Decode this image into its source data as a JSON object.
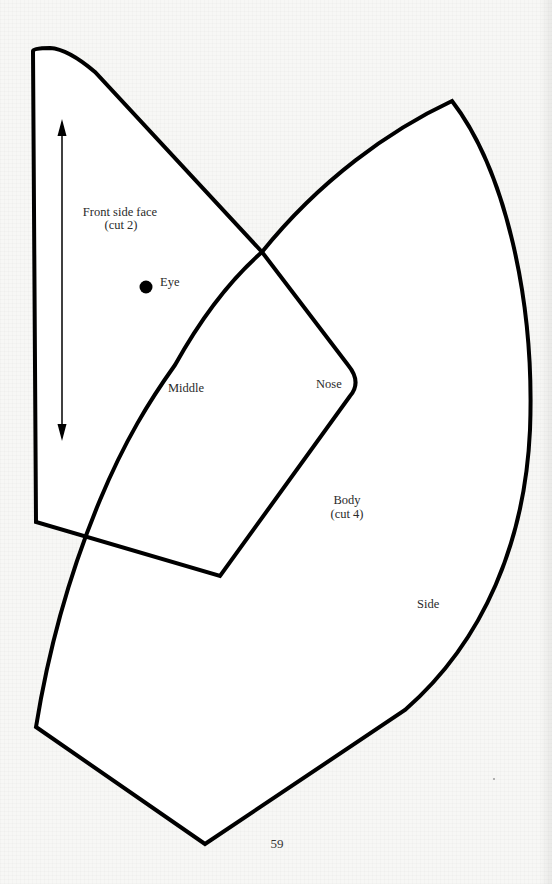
{
  "diagram": {
    "type": "sewing-pattern",
    "pieces": [
      {
        "id": "front-side-face",
        "title": "Front side face",
        "cut": "(cut 2)",
        "markings": {
          "eye_label": "Eye",
          "grainline": "double-headed-arrow"
        },
        "edge_labels": {
          "middle": "Middle",
          "nose": "Nose"
        }
      },
      {
        "id": "body",
        "title": "Body",
        "cut": "(cut 4)",
        "edge_labels": {
          "side": "Side"
        }
      }
    ],
    "colors": {
      "outline": "#000000",
      "fill": "#ffffff",
      "page": "#f7f7f5"
    }
  },
  "footer": {
    "page_number": "59"
  }
}
